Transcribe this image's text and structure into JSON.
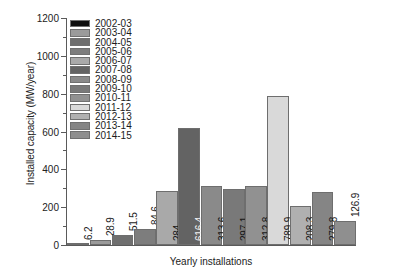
{
  "chart_data": {
    "type": "bar",
    "title": "",
    "xlabel": "Yearly installations",
    "ylabel": "Installed capacity (MW/year)",
    "ylim": [
      0,
      1200
    ],
    "yticks": [
      0,
      200,
      400,
      600,
      800,
      1000,
      1200
    ],
    "ytick_labels": [
      "0",
      "200",
      "400",
      "600",
      "800",
      "1000",
      "1200"
    ],
    "minor_yticks": [
      100,
      300,
      500,
      700,
      900,
      1100
    ],
    "grid": false,
    "legend_position": "upper-left-inside",
    "categories": [
      "2002-03",
      "2003-04",
      "2004-05",
      "2005-06",
      "2006-07",
      "2007-08",
      "2008-09",
      "2009-10",
      "2010-11",
      "2011-12",
      "2012-13",
      "2013-14",
      "2014-15"
    ],
    "values": [
      6.2,
      28.9,
      51.5,
      84.6,
      284,
      616.4,
      313.6,
      297.1,
      312.8,
      789.9,
      208.3,
      279.8,
      126.9
    ],
    "value_labels": [
      "6.2",
      "28.9",
      "51.5",
      "84.6",
      "284",
      "616.4",
      "313.6",
      "297.1",
      "312.8",
      "789.9",
      "208.3",
      "279.8",
      "126.9"
    ],
    "bar_colors": [
      "#0e0e0e",
      "#9b9b9b",
      "#6f6f6f",
      "#7d7d7d",
      "#a9a9a9",
      "#636363",
      "#8a8a8a",
      "#797979",
      "#919191",
      "#d9d9d9",
      "#b0b0b0",
      "#858585",
      "#8f8f8f"
    ],
    "legend_entries": [
      {
        "label": "2002-03",
        "color": "#0e0e0e"
      },
      {
        "label": "2003-04",
        "color": "#9b9b9b"
      },
      {
        "label": "2004-05",
        "color": "#6f6f6f"
      },
      {
        "label": "2005-06",
        "color": "#7d7d7d"
      },
      {
        "label": "2006-07",
        "color": "#a9a9a9"
      },
      {
        "label": "2007-08",
        "color": "#636363"
      },
      {
        "label": "2008-09",
        "color": "#8a8a8a"
      },
      {
        "label": "2009-10",
        "color": "#797979"
      },
      {
        "label": "2010-11",
        "color": "#919191"
      },
      {
        "label": "2011-12",
        "color": "#d9d9d9"
      },
      {
        "label": "2012-13",
        "color": "#b0b0b0"
      },
      {
        "label": "2013-14",
        "color": "#858585"
      },
      {
        "label": "2014-15",
        "color": "#8f8f8f"
      }
    ]
  }
}
